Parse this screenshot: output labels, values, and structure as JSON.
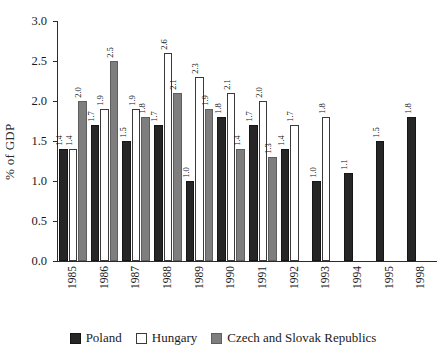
{
  "chart_data": {
    "type": "bar",
    "title": "",
    "subtitle": "",
    "xlabel": "",
    "ylabel": "% of GDP",
    "ylim": [
      0.0,
      3.0
    ],
    "ytick_labels": [
      "0.0",
      "0.5",
      "1.0",
      "1.5",
      "2.0",
      "2.5",
      "3.0"
    ],
    "ytick_values": [
      0.0,
      0.5,
      1.0,
      1.5,
      2.0,
      2.5,
      3.0
    ],
    "grid": false,
    "legend_position": "bottom-center",
    "categories": [
      "1985",
      "1986",
      "1987",
      "1988",
      "1989",
      "1990",
      "1991",
      "1992",
      "1993",
      "1994",
      "1995",
      "1998"
    ],
    "series": [
      {
        "name": "Poland",
        "color": "#262626",
        "values": [
          1.4,
          1.7,
          1.5,
          1.7,
          1.0,
          1.8,
          1.7,
          1.4,
          1.0,
          1.1,
          1.5,
          1.8
        ],
        "labels": [
          "1.4",
          "1.7",
          "1.5",
          "1.7",
          "1.0",
          "1.8",
          "1.7",
          "1.4",
          "1.0",
          "1.1",
          "1.5",
          "1.8"
        ]
      },
      {
        "name": "Hungary",
        "color": "#ffffff",
        "values": [
          1.4,
          1.9,
          1.9,
          2.6,
          2.3,
          2.1,
          2.0,
          1.7,
          1.8,
          null,
          null,
          null
        ],
        "labels": [
          "1.4",
          "1.9",
          "1.9",
          "2.6",
          "2.3",
          "2.1",
          "2.0",
          "1.7",
          "1.8",
          "",
          "",
          ""
        ]
      },
      {
        "name": "Czech and Slovak Republics",
        "color": "#7e7e7e",
        "values": [
          2.0,
          2.5,
          1.8,
          2.1,
          1.9,
          1.4,
          1.3,
          null,
          null,
          null,
          null,
          null
        ],
        "labels": [
          "2.0",
          "2.5",
          "1.8",
          "2.1",
          "1.9",
          "1.4",
          "1.3",
          "",
          "",
          "",
          "",
          ""
        ]
      }
    ]
  },
  "legend": {
    "entries": [
      {
        "label": "Poland",
        "key": "poland"
      },
      {
        "label": "Hungary",
        "key": "hungary"
      },
      {
        "label": "Czech and Slovak Republics",
        "key": "czech"
      }
    ]
  }
}
